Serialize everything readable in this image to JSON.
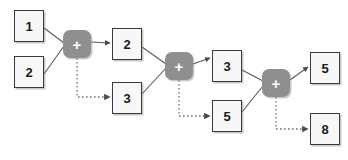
{
  "diagram": {
    "type": "ripple-carry-adder-flow",
    "canvas": {
      "width": 348,
      "height": 160,
      "background": "#ffffff"
    },
    "colors": {
      "box_fill": "#f7f7f7",
      "box_border": "#3a3a3a",
      "operator_fill": "#8f8f8f",
      "operator_label": "#ffffff",
      "solid_edge": "#595959",
      "dotted_edge": "#6e6e6e"
    },
    "nodes": [
      {
        "id": "in1",
        "label": "1",
        "kind": "value",
        "x": 14,
        "y": 10,
        "w": 30,
        "h": 32
      },
      {
        "id": "in2",
        "label": "2",
        "kind": "value",
        "x": 14,
        "y": 56,
        "w": 30,
        "h": 32
      },
      {
        "id": "plus1",
        "label": "+",
        "kind": "operator",
        "x": 63,
        "y": 30,
        "w": 28,
        "h": 28
      },
      {
        "id": "sum1",
        "label": "2",
        "kind": "value",
        "x": 112,
        "y": 28,
        "w": 30,
        "h": 32
      },
      {
        "id": "carry1",
        "label": "3",
        "kind": "value",
        "x": 112,
        "y": 82,
        "w": 30,
        "h": 32
      },
      {
        "id": "plus2",
        "label": "+",
        "kind": "operator",
        "x": 165,
        "y": 52,
        "w": 28,
        "h": 28
      },
      {
        "id": "sum2",
        "label": "3",
        "kind": "value",
        "x": 212,
        "y": 50,
        "w": 30,
        "h": 32
      },
      {
        "id": "carry2",
        "label": "5",
        "kind": "value",
        "x": 212,
        "y": 100,
        "w": 30,
        "h": 32
      },
      {
        "id": "plus3",
        "label": "+",
        "kind": "operator",
        "x": 262,
        "y": 69,
        "w": 28,
        "h": 28
      },
      {
        "id": "sum3",
        "label": "5",
        "kind": "value",
        "x": 310,
        "y": 52,
        "w": 30,
        "h": 32
      },
      {
        "id": "carry3",
        "label": "8",
        "kind": "value",
        "x": 310,
        "y": 113,
        "w": 30,
        "h": 32
      }
    ],
    "edges": [
      {
        "id": "e-in1-plus1",
        "from": "in1",
        "to": "plus1",
        "style": "solid",
        "arrow": false
      },
      {
        "id": "e-in2-plus1",
        "from": "in2",
        "to": "plus1",
        "style": "solid",
        "arrow": false
      },
      {
        "id": "e-plus1-sum1",
        "from": "plus1",
        "to": "sum1",
        "style": "solid",
        "arrow": true
      },
      {
        "id": "e-plus1-carry1",
        "from": "plus1",
        "to": "carry1",
        "style": "dotted",
        "arrow": true
      },
      {
        "id": "e-sum1-plus2",
        "from": "sum1",
        "to": "plus2",
        "style": "solid",
        "arrow": false
      },
      {
        "id": "e-carry1-plus2",
        "from": "carry1",
        "to": "plus2",
        "style": "solid",
        "arrow": false
      },
      {
        "id": "e-plus2-sum2",
        "from": "plus2",
        "to": "sum2",
        "style": "solid",
        "arrow": true
      },
      {
        "id": "e-plus2-carry2",
        "from": "plus2",
        "to": "carry2",
        "style": "dotted",
        "arrow": true
      },
      {
        "id": "e-sum2-plus3",
        "from": "sum2",
        "to": "plus3",
        "style": "solid",
        "arrow": false
      },
      {
        "id": "e-carry2-plus3",
        "from": "carry2",
        "to": "plus3",
        "style": "solid",
        "arrow": false
      },
      {
        "id": "e-plus3-sum3",
        "from": "plus3",
        "to": "sum3",
        "style": "solid",
        "arrow": true
      },
      {
        "id": "e-plus3-carry3",
        "from": "plus3",
        "to": "carry3",
        "style": "dotted",
        "arrow": true
      }
    ]
  }
}
